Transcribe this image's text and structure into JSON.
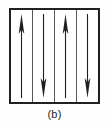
{
  "figure": {
    "caption": "(b)",
    "label": "(b)",
    "colors": {
      "background": "#ffffff",
      "border": "#231f20",
      "domain_wall": "#58585b",
      "arrow": "#231f20",
      "caption": "#231f20"
    }
  },
  "chart_data": {
    "type": "diagram",
    "title": "(b)",
    "subtype": "magnetic-domain-schematic",
    "box": {
      "x": 9,
      "y": 8,
      "width": 91,
      "height": 96,
      "border_width": 2
    },
    "domain_count": 4,
    "wall_count": 3,
    "domains": [
      {
        "index": 1,
        "direction": "up",
        "arrow_symbol": "↑",
        "magnetization": "+1"
      },
      {
        "index": 2,
        "direction": "down",
        "arrow_symbol": "↓",
        "magnetization": "-1"
      },
      {
        "index": 3,
        "direction": "up",
        "arrow_symbol": "↑",
        "magnetization": "+1"
      },
      {
        "index": 4,
        "direction": "down",
        "arrow_symbol": "↓",
        "magnetization": "-1"
      }
    ],
    "legend": [],
    "xlabel": "",
    "ylabel": "",
    "grid": false
  }
}
